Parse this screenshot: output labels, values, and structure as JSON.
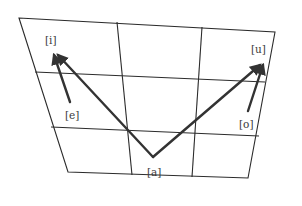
{
  "diagram": {
    "title": "",
    "type": "vowel-quadrilateral",
    "colors": {
      "background": "#ffffff",
      "lines": "#2b2b2b",
      "arrows": "#333333",
      "text": "#3a3a3a"
    },
    "labels": {
      "i": "[i]",
      "u": "[u]",
      "e": "[e]",
      "o": "[o]",
      "a": "[a]"
    },
    "arrows": [
      {
        "from": "[a]",
        "to": "[i]"
      },
      {
        "from": "[a]",
        "to": "[u]"
      },
      {
        "from": "[e]",
        "to": "[i]"
      },
      {
        "from": "[o]",
        "to": "[u]"
      }
    ],
    "grid": {
      "rows": 3,
      "columns": 3
    }
  }
}
